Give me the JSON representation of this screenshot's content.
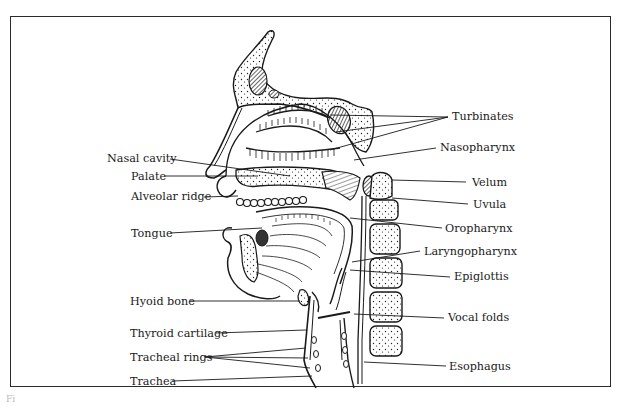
{
  "figure": {
    "caption_fragment": "Fi",
    "frame_color": "#2b2b2b",
    "ink_color": "#1a1a1a"
  },
  "labels_left": [
    {
      "id": "nasal-cavity",
      "text": "Nasal cavity",
      "x": 107,
      "y": 156
    },
    {
      "id": "palate",
      "text": "Palate",
      "x": 131,
      "y": 177
    },
    {
      "id": "alveolar-ridge",
      "text": "Alveolar ridge",
      "x": 131,
      "y": 194
    },
    {
      "id": "tongue",
      "text": "Tongue",
      "x": 131,
      "y": 228
    },
    {
      "id": "hyoid-bone",
      "text": "Hyoid bone",
      "x": 130,
      "y": 296
    },
    {
      "id": "thyroid-cartilage",
      "text": "Thyroid cartilage",
      "x": 130,
      "y": 328
    },
    {
      "id": "tracheal-rings",
      "text": "Tracheal rings",
      "x": 130,
      "y": 353
    },
    {
      "id": "trachea",
      "text": "Trachea",
      "x": 130,
      "y": 376
    }
  ],
  "labels_right": [
    {
      "id": "turbinates",
      "text": "Turbinates",
      "x": 452,
      "y": 111
    },
    {
      "id": "nasopharynx",
      "text": "Nasopharynx",
      "x": 440,
      "y": 142
    },
    {
      "id": "velum",
      "text": "Velum",
      "x": 472,
      "y": 177
    },
    {
      "id": "uvula",
      "text": "Uvula",
      "x": 473,
      "y": 199
    },
    {
      "id": "oropharynx",
      "text": "Oropharynx",
      "x": 445,
      "y": 223
    },
    {
      "id": "laryngopharynx",
      "text": "Laryngopharynx",
      "x": 424,
      "y": 246
    },
    {
      "id": "epiglottis",
      "text": "Epiglottis",
      "x": 454,
      "y": 271
    },
    {
      "id": "vocal-folds",
      "text": "Vocal folds",
      "x": 448,
      "y": 312
    },
    {
      "id": "esophagus",
      "text": "Esophagus",
      "x": 449,
      "y": 361
    }
  ]
}
